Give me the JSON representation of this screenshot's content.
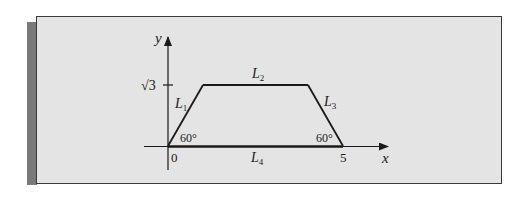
{
  "figure": {
    "type": "trapezoid-diagram",
    "axes": {
      "x_label": "x",
      "y_label": "y",
      "origin_label": "0",
      "x_tick_label": "5",
      "y_tick_label": "√3"
    },
    "segments": [
      {
        "id": "L1",
        "label": "L",
        "subscript": "1"
      },
      {
        "id": "L2",
        "label": "L",
        "subscript": "2"
      },
      {
        "id": "L3",
        "label": "L",
        "subscript": "3"
      },
      {
        "id": "L4",
        "label": "L",
        "subscript": "4"
      }
    ],
    "angles": {
      "left": "60°",
      "right": "60°"
    },
    "vertices": [
      {
        "name": "origin",
        "x": 0,
        "y": 0
      },
      {
        "name": "top-left",
        "x": 1,
        "y": "√3"
      },
      {
        "name": "top-right",
        "x": 4,
        "y": "√3"
      },
      {
        "name": "bottom-right",
        "x": 5,
        "y": 0
      }
    ],
    "colors": {
      "panel": "#e4e4e4",
      "border": "#3a3a3a",
      "shadow": "#7a7a7a",
      "ink": "#1a1a1a"
    }
  }
}
